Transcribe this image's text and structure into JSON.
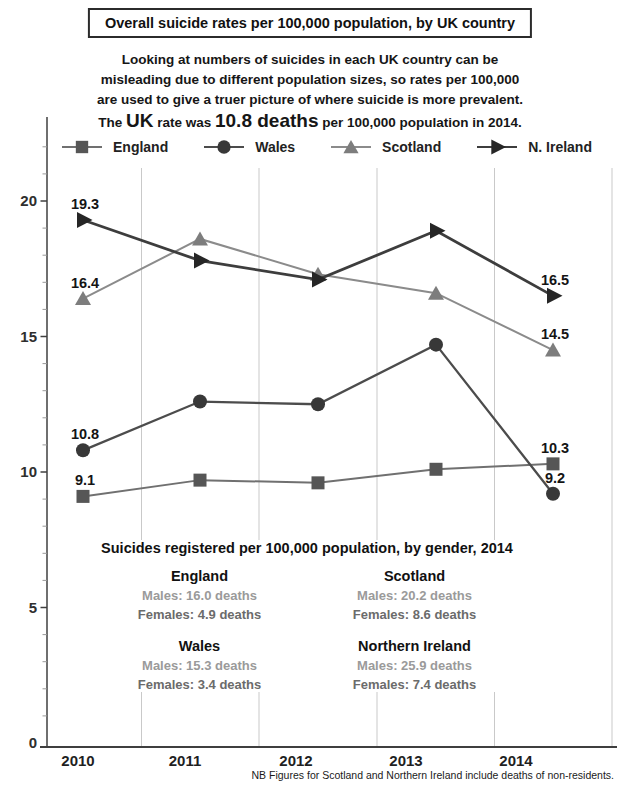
{
  "header": {
    "title": "Overall suicide rates per 100,000 population, by UK country"
  },
  "intro": {
    "line1": "Looking at numbers of suicides in each UK country can be",
    "line2": "misleading due to different population sizes, so rates per 100,000",
    "line3": "are used to give a truer picture of where suicide is more prevalent.",
    "line4_prefix": "The ",
    "line4_uk": "UK",
    "line4_mid": " rate was ",
    "line4_rate": "10.8 deaths",
    "line4_suffix": " per 100,000 population in 2014."
  },
  "legend": {
    "items": [
      {
        "label": "England",
        "shape": "square"
      },
      {
        "label": "Wales",
        "shape": "circle"
      },
      {
        "label": "Scotland",
        "shape": "triangle"
      },
      {
        "label": "N. Ireland",
        "shape": "arrow"
      }
    ]
  },
  "chart_data": {
    "type": "line",
    "title": "Overall suicide rates per 100,000 population, by UK country",
    "categories": [
      "2010",
      "2011",
      "2012",
      "2013",
      "2014"
    ],
    "series": [
      {
        "name": "England",
        "marker": "square",
        "line_color": "#707070",
        "marker_color": "#565656",
        "values": [
          9.1,
          9.7,
          9.6,
          10.1,
          10.3
        ]
      },
      {
        "name": "Wales",
        "marker": "circle",
        "line_color": "#4c4c4c",
        "marker_color": "#383838",
        "values": [
          10.8,
          12.6,
          12.5,
          14.7,
          9.2
        ]
      },
      {
        "name": "Scotland",
        "marker": "triangle",
        "line_color": "#8b8b8b",
        "marker_color": "#7d7d7d",
        "values": [
          16.4,
          18.6,
          17.3,
          16.6,
          14.5
        ]
      },
      {
        "name": "N. Ireland",
        "marker": "arrow",
        "line_color": "#3d3d3d",
        "marker_color": "#262626",
        "values": [
          19.3,
          17.8,
          17.1,
          18.9,
          16.5
        ]
      }
    ],
    "xlabel": "",
    "ylabel": "",
    "ylim": [
      0,
      22.8
    ],
    "yticks_labeled": [
      20,
      15,
      10,
      5,
      0
    ],
    "minor_tick_step": 1,
    "grid": "vertical-category-boundaries",
    "point_labels": "first-and-last-of-each-series",
    "legend_position": "top"
  },
  "gender_stats": {
    "heading": "Suicides registered per 100,000 population, by gender, 2014",
    "countries": [
      {
        "name": "England",
        "males": "Males: 16.0 deaths",
        "females": "Females: 4.9 deaths"
      },
      {
        "name": "Scotland",
        "males": "Males: 20.2 deaths",
        "females": "Females: 8.6 deaths"
      },
      {
        "name": "Wales",
        "males": "Males: 15.3 deaths",
        "females": "Females: 3.4 deaths"
      },
      {
        "name": "Northern Ireland",
        "males": "Males: 25.9 deaths",
        "females": "Females: 7.4 deaths"
      }
    ]
  },
  "footnote": "NB Figures for Scotland and Northern Ireland include deaths of non-residents.",
  "colors": {
    "grid": "#c9c9c9",
    "axis": "#3f3f3f",
    "tick_label": "#2e2e2e",
    "data_label": "#141414",
    "year_label": "#1f1f1f",
    "males_text": "#9a9a9a",
    "females_text": "#6b6b6b"
  }
}
